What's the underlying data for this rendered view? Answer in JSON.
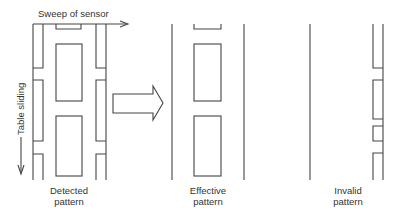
{
  "diagram": {
    "labels": {
      "sweep": "Sweep of sensor",
      "table": "Table sliding",
      "detected_line1": "Detected",
      "detected_line2": "pattern",
      "effective_line1": "Effective",
      "effective_line2": "pattern",
      "invalid_line1": "Invalid",
      "invalid_line2": "pattern"
    },
    "panels": [
      "Detected pattern",
      "Effective pattern",
      "Invalid pattern"
    ],
    "transform_arrow": "block-arrow-right",
    "colors": {
      "line": "#444444",
      "text": "#333333",
      "background": "#ffffff"
    }
  }
}
